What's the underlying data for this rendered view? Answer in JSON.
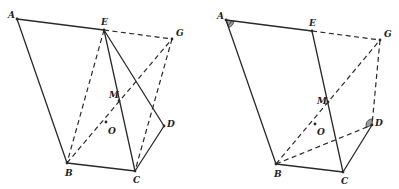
{
  "figures": [
    {
      "id": "left",
      "points": {
        "A": {
          "x": 17,
          "y": 19,
          "label": "A",
          "lx": 8,
          "ly": 18
        },
        "E": {
          "x": 104,
          "y": 30,
          "label": "E",
          "lx": 101,
          "ly": 25
        },
        "G": {
          "x": 172,
          "y": 39,
          "label": "G",
          "lx": 176,
          "ly": 36
        },
        "M": {
          "x": 119,
          "y": 101,
          "label": "M",
          "lx": 109,
          "ly": 98
        },
        "O": {
          "x": 106,
          "y": 122,
          "label": "O",
          "lx": 108,
          "ly": 134
        },
        "D": {
          "x": 164,
          "y": 126,
          "label": "D",
          "lx": 167,
          "ly": 127
        },
        "B": {
          "x": 67,
          "y": 163,
          "label": "B",
          "lx": 65,
          "ly": 176
        },
        "C": {
          "x": 135,
          "y": 171,
          "label": "C",
          "lx": 133,
          "ly": 183
        }
      },
      "solid_segments": [
        [
          "A",
          "E"
        ],
        [
          "A",
          "B"
        ],
        [
          "B",
          "C"
        ],
        [
          "C",
          "D"
        ],
        [
          "D",
          "E"
        ],
        [
          "E",
          "C"
        ]
      ],
      "dashed_segments": [
        [
          "E",
          "G"
        ],
        [
          "E",
          "B"
        ],
        [
          "B",
          "G"
        ],
        [
          "G",
          "C"
        ]
      ],
      "angle_marks": []
    },
    {
      "id": "right",
      "points": {
        "A": {
          "x": 226,
          "y": 20,
          "label": "A",
          "lx": 217,
          "ly": 19
        },
        "E": {
          "x": 312,
          "y": 31,
          "label": "E",
          "lx": 309,
          "ly": 26
        },
        "G": {
          "x": 380,
          "y": 40,
          "label": "G",
          "lx": 384,
          "ly": 37
        },
        "M": {
          "x": 328,
          "y": 102,
          "label": "M",
          "lx": 317,
          "ly": 104
        },
        "O": {
          "x": 315,
          "y": 124,
          "label": "O",
          "lx": 317,
          "ly": 135
        },
        "D": {
          "x": 372,
          "y": 125,
          "label": "D",
          "lx": 375,
          "ly": 126
        },
        "B": {
          "x": 276,
          "y": 164,
          "label": "B",
          "lx": 274,
          "ly": 177
        },
        "C": {
          "x": 343,
          "y": 172,
          "label": "C",
          "lx": 341,
          "ly": 184
        }
      },
      "solid_segments": [
        [
          "A",
          "E"
        ],
        [
          "A",
          "B"
        ],
        [
          "B",
          "C"
        ],
        [
          "C",
          "D"
        ],
        [
          "E",
          "C"
        ]
      ],
      "dashed_segments": [
        [
          "E",
          "G"
        ],
        [
          "B",
          "G"
        ],
        [
          "G",
          "D"
        ],
        [
          "B",
          "D"
        ]
      ],
      "angle_marks": [
        {
          "vertex": "A",
          "from": "E",
          "to": "B",
          "r": 8,
          "double": true
        },
        {
          "vertex": "D",
          "from": "G",
          "to": "B",
          "r": 6,
          "double": false
        }
      ]
    }
  ],
  "colors": {
    "line": "#2a2a2a",
    "angle_fill": "#9a9a9a",
    "background": "#ffffff"
  }
}
